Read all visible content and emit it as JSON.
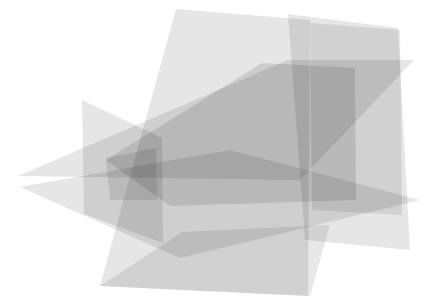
{
  "canvas": {
    "width": 425,
    "height": 296,
    "background_color": "#ffffff",
    "title": "Overlapping translucent planes"
  },
  "render": {
    "blend_mode": "multiply",
    "base_fill_color": "#808080",
    "observed_tones": {
      "background": "#ffffff",
      "one_layer": "#dcdcdc",
      "two_layers": "#c4c4c4",
      "three_layers": "#a8a8a8",
      "four_layers": "#8c8c8c",
      "darkest": "#6e6e6e"
    }
  },
  "shapes": [
    {
      "name": "tall-vertical-plane",
      "id": "plane-tall-vertical",
      "fill": "#808080",
      "opacity": 0.2,
      "points": "176,9 310,20 308,296 100,286"
    },
    {
      "name": "wide-back-plane",
      "id": "plane-wide-back",
      "fill": "#808080",
      "opacity": 0.2,
      "points": "288,14 398,28 410,250 305,240"
    },
    {
      "name": "left-vertical-plane",
      "id": "plane-left-vertical",
      "fill": "#808080",
      "opacity": 0.2,
      "points": "82,100 162,138 163,243 84,214"
    },
    {
      "name": "upper-wedge-plane",
      "id": "plane-upper-wedge",
      "fill": "#808080",
      "opacity": 0.2,
      "points": "18,176 288,60 414,60 300,180"
    },
    {
      "name": "lower-wedge-plane",
      "id": "plane-lower-wedge",
      "fill": "#808080",
      "opacity": 0.2,
      "points": "20,187 230,150 420,200 180,258"
    },
    {
      "name": "central-dark-slab",
      "id": "plane-central-slab",
      "fill": "#808080",
      "opacity": 0.22,
      "points": "262,63 355,68 356,200 170,206 106,160"
    },
    {
      "name": "right-back-panel",
      "id": "plane-right-back",
      "fill": "#808080",
      "opacity": 0.18,
      "points": "310,23 400,30 402,215 312,210"
    },
    {
      "name": "bottom-fan-plane",
      "id": "plane-bottom-fan",
      "fill": "#808080",
      "opacity": 0.18,
      "points": "100,286 182,232 330,225 310,296"
    },
    {
      "name": "dark-core-quad",
      "id": "plane-dark-core",
      "fill": "#808080",
      "opacity": 0.2,
      "points": "106,158 156,148 157,200 110,200"
    }
  ],
  "accessibility": {
    "alt_text": "Abstract composition of several semi-transparent gray quadrilateral planes overlapping in three-dimensional space, darker where layers intersect."
  }
}
